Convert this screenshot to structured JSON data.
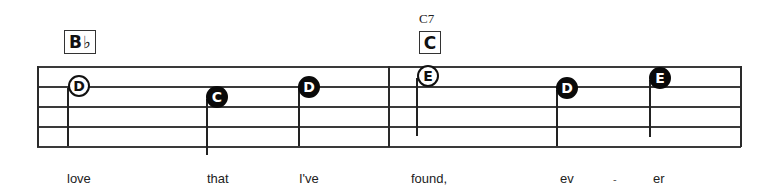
{
  "chords": [
    {
      "root": "B",
      "accidental": "♭",
      "name": ""
    },
    {
      "root": "C",
      "accidental": "",
      "name": "C7"
    }
  ],
  "notes": [
    {
      "letter": "D",
      "style": "hollow",
      "x": 79,
      "y": 86
    },
    {
      "letter": "C",
      "style": "filled",
      "x": 217,
      "y": 97
    },
    {
      "letter": "D",
      "style": "filled",
      "x": 309,
      "y": 87
    },
    {
      "letter": "E",
      "style": "hollow",
      "x": 428,
      "y": 76
    },
    {
      "letter": "D",
      "style": "filled",
      "x": 567,
      "y": 88
    },
    {
      "letter": "E",
      "style": "filled",
      "x": 660,
      "y": 78
    }
  ],
  "lyrics": {
    "words": [
      "love",
      "that",
      "I've",
      "found,",
      "ev",
      "er"
    ],
    "hyphen": "-"
  },
  "colors": {
    "ink": "#111111",
    "staff": "#3a3a3a",
    "background": "#ffffff"
  }
}
